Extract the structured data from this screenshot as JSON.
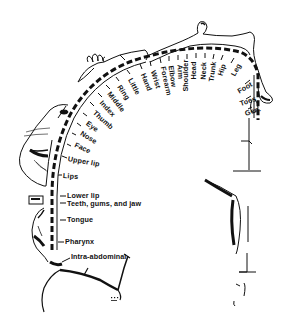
{
  "diagram": {
    "type": "sensory-homunculus",
    "line_color": "#111111",
    "background": "#ffffff",
    "labels": [
      {
        "id": "gen",
        "text": "Gen.",
        "x": 245,
        "y": 113,
        "rot": -18
      },
      {
        "id": "toes",
        "text": "Toes",
        "x": 240,
        "y": 103,
        "rot": -18
      },
      {
        "id": "foot",
        "text": "Foot",
        "x": 242,
        "y": 89,
        "rot": -30
      },
      {
        "id": "leg",
        "text": "Leg",
        "x": 237,
        "y": 65,
        "rot": -62
      },
      {
        "id": "hip",
        "text": "Hip",
        "x": 224,
        "y": 62,
        "rot": -70
      },
      {
        "id": "trunk",
        "text": "Trunk",
        "x": 214,
        "y": 64,
        "rot": -80
      },
      {
        "id": "neck",
        "text": "Neck",
        "x": 205,
        "y": 62,
        "rot": -86
      },
      {
        "id": "head",
        "text": "Head",
        "x": 196,
        "y": 63,
        "rot": -90
      },
      {
        "id": "shoulder",
        "text": "Shoulder",
        "x": 188,
        "y": 75,
        "rot": -90
      },
      {
        "id": "arm",
        "text": "Arm",
        "x": 179,
        "y": 66,
        "rot": 90
      },
      {
        "id": "elbow",
        "text": "Elbow",
        "x": 170,
        "y": 63,
        "rot": 80
      },
      {
        "id": "forearm",
        "text": "Forearm",
        "x": 162,
        "y": 60,
        "rot": 78
      },
      {
        "id": "wrist",
        "text": "Wrist",
        "x": 152,
        "y": 70,
        "rot": 70
      },
      {
        "id": "hand",
        "text": "Hand",
        "x": 143,
        "y": 72,
        "rot": 68
      },
      {
        "id": "little",
        "text": "Little",
        "x": 129,
        "y": 80,
        "rot": 62
      },
      {
        "id": "ring",
        "text": "Ring",
        "x": 117,
        "y": 88,
        "rot": 56
      },
      {
        "id": "middle",
        "text": "Middle",
        "x": 107,
        "y": 96,
        "rot": 52
      },
      {
        "id": "index",
        "text": "Index",
        "x": 98,
        "y": 105,
        "rot": 48
      },
      {
        "id": "thumb",
        "text": "Thumb",
        "x": 90,
        "y": 115,
        "rot": 42
      },
      {
        "id": "eye",
        "text": "Eye",
        "x": 83,
        "y": 126,
        "rot": 36
      },
      {
        "id": "nose",
        "text": "Nose",
        "x": 77,
        "y": 136,
        "rot": 32
      },
      {
        "id": "face",
        "text": "Face",
        "x": 72,
        "y": 146,
        "rot": 26
      },
      {
        "id": "upper_lip",
        "text": "Upper lip",
        "x": 68,
        "y": 157,
        "rot": 12
      },
      {
        "id": "lips",
        "text": "Lips",
        "x": 63,
        "y": 174,
        "rot": 5
      },
      {
        "id": "lower_lip",
        "text": "Lower lip",
        "x": 68,
        "y": 194,
        "rot": 0
      },
      {
        "id": "teeth_gums_jaw",
        "text": "Teeth, gums, and jaw",
        "x": 68,
        "y": 202,
        "rot": 0
      },
      {
        "id": "tongue",
        "text": "Tongue",
        "x": 68,
        "y": 219,
        "rot": 0
      },
      {
        "id": "pharynx",
        "text": "Pharynx",
        "x": 66,
        "y": 241,
        "rot": 0
      },
      {
        "id": "intra_abdominal",
        "text": "Intra-abdominal",
        "x": 72,
        "y": 256,
        "rot": 0
      }
    ]
  }
}
